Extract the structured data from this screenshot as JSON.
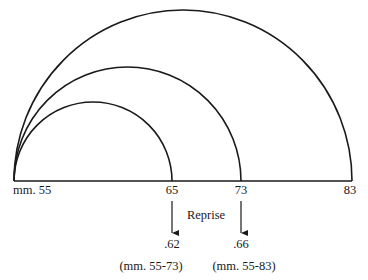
{
  "diagram": {
    "type": "nested-arcs",
    "baseline_labels": {
      "start": "mm. 55",
      "m65": "65",
      "m73": "73",
      "m83": "83"
    },
    "arcs": [
      {
        "name": "inner",
        "from": "55",
        "to": "65"
      },
      {
        "name": "middle",
        "from": "55",
        "to": "73"
      },
      {
        "name": "outer",
        "from": "55",
        "to": "83"
      }
    ],
    "reprise_label": "Reprise",
    "ratios": [
      {
        "value": ".62",
        "range": "(mm. 55-73)"
      },
      {
        "value": ".66",
        "range": "(mm. 55-83)"
      }
    ],
    "colors": {
      "stroke": "#1a1a1a",
      "background": "#ffffff"
    }
  }
}
